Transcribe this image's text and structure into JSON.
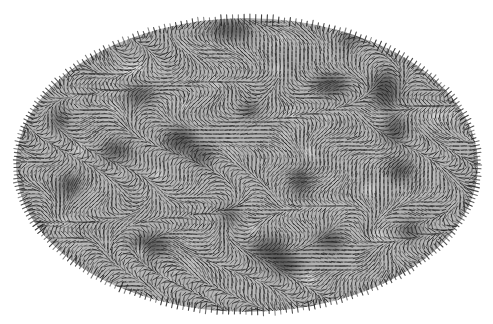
{
  "figure": {
    "type": "all-sky map",
    "projection": "mollweide",
    "colors": {
      "background": "#ffffff",
      "map_base": "#b4b4b4",
      "dark_blob": "#4a4a4a",
      "light_spot": "#efefef",
      "vector": "#1e1e1e"
    },
    "ellipse": {
      "cx": 247,
      "cy": 165,
      "rx": 231,
      "ry": 147
    }
  }
}
